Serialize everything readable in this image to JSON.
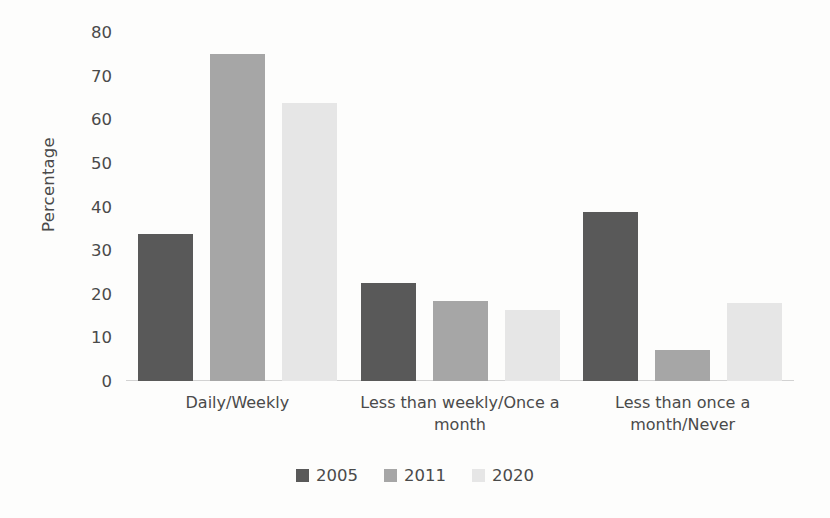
{
  "chart_data": {
    "type": "bar",
    "title": "",
    "subtitle": "",
    "xlabel": "",
    "ylabel": "Percentage",
    "ylim": [
      0,
      80
    ],
    "ytick_step": 10,
    "yticks": [
      "80",
      "70",
      "60",
      "50",
      "40",
      "30",
      "20",
      "10",
      "0"
    ],
    "grid": false,
    "legend_position": "bottom",
    "categories": [
      "Daily/Weekly",
      "Less than weekly/Once a month",
      "Less than once a month/Never"
    ],
    "series": [
      {
        "name": "2005",
        "color": "#595959",
        "values": [
          33.7,
          22.5,
          38.8
        ]
      },
      {
        "name": "2011",
        "color": "#a6a6a6",
        "values": [
          74.9,
          18.3,
          7.0
        ]
      },
      {
        "name": "2020",
        "color": "#e6e6e6",
        "values": [
          63.7,
          16.3,
          17.9
        ]
      }
    ]
  }
}
